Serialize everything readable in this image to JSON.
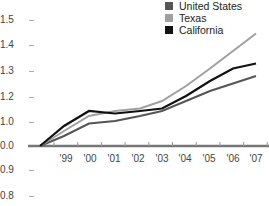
{
  "chart_data": {
    "type": "line",
    "title": "",
    "xlabel": "",
    "ylabel": "",
    "x": [
      "'98",
      "'99",
      "'00",
      "'01",
      "'02",
      "'03",
      "'04",
      "'05",
      "'06",
      "'07"
    ],
    "x_tick_labels": [
      "'99",
      "'00",
      "'01",
      "'02",
      "'03",
      "'04",
      "'05",
      "'06",
      "'07"
    ],
    "y_tick_labels": [
      "1.5",
      "1.4",
      "1.3",
      "1.2",
      "1.0",
      "0.0",
      "0.9",
      "0.8"
    ],
    "series": [
      {
        "name": "United States",
        "color": "#555555",
        "values": [
          1.0,
          1.04,
          1.09,
          1.1,
          1.12,
          1.14,
          1.18,
          1.22,
          1.25,
          1.28
        ]
      },
      {
        "name": "Texas",
        "color": "#a0a0a0",
        "values": [
          1.0,
          1.06,
          1.12,
          1.14,
          1.15,
          1.18,
          1.24,
          1.31,
          1.38,
          1.45
        ]
      },
      {
        "name": "California",
        "color": "#111111",
        "values": [
          1.0,
          1.08,
          1.14,
          1.13,
          1.14,
          1.15,
          1.2,
          1.26,
          1.31,
          1.33
        ]
      }
    ],
    "legend_position": "top-right",
    "grid": false
  },
  "legend": [
    {
      "label": "United States",
      "color": "#555555"
    },
    {
      "label": "Texas",
      "color": "#a0a0a0"
    },
    {
      "label": "California",
      "color": "#111111"
    }
  ],
  "y_labels": [
    {
      "label": "1.5",
      "y": 20
    },
    {
      "label": "1.4",
      "y": 45
    },
    {
      "label": "1.3",
      "y": 71
    },
    {
      "label": "1.2",
      "y": 97
    },
    {
      "label": "1.0",
      "y": 122
    },
    {
      "label": "0.0",
      "y": 146
    },
    {
      "label": "0.9",
      "y": 170
    },
    {
      "label": "0.8",
      "y": 196
    }
  ],
  "x_labels": [
    {
      "label": "'99",
      "x": 66
    },
    {
      "label": "'00",
      "x": 90
    },
    {
      "label": "'01",
      "x": 114
    },
    {
      "label": "'02",
      "x": 138
    },
    {
      "label": "'03",
      "x": 162
    },
    {
      "label": "'04",
      "x": 185
    },
    {
      "label": "'05",
      "x": 209
    },
    {
      "label": "'06",
      "x": 233
    },
    {
      "label": "'07",
      "x": 256
    }
  ]
}
